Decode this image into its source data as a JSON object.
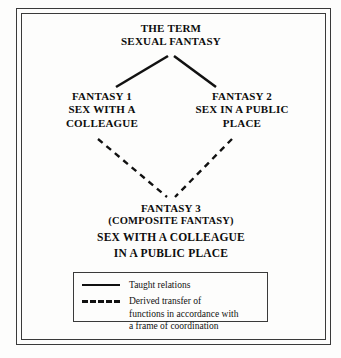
{
  "figure": {
    "background_color": "#fdfdfc",
    "border_color": "#3a3a3a",
    "line_color": "#111111"
  },
  "nodes": {
    "term": {
      "line1": "THE TERM",
      "line2": "SEXUAL FANTASY"
    },
    "fantasy1": {
      "line1": "FANTASY 1",
      "line2": "SEX WITH A",
      "line3": "COLLEAGUE"
    },
    "fantasy2": {
      "line1": "FANTASY 2",
      "line2": "SEX IN A PUBLIC",
      "line3": "PLACE"
    },
    "fantasy3": {
      "line1": "FANTASY 3",
      "line2": "(COMPOSITE FANTASY)",
      "line3": "SEX WITH A COLLEAGUE",
      "line4": "IN A PUBLIC PLACE"
    }
  },
  "legend": {
    "taught": {
      "label": "Taught relations",
      "style": "solid"
    },
    "derived": {
      "line1": "Derived transfer of",
      "line2": "functions in accordance with",
      "line3": "a frame of coordination",
      "style": "dashed"
    }
  },
  "connectors": [
    {
      "name": "taught-term-to-fantasy1",
      "style": "solid",
      "x1": 168,
      "y1": 56,
      "x2": 116,
      "y2": 87
    },
    {
      "name": "taught-term-to-fantasy2",
      "style": "solid",
      "x1": 174,
      "y1": 56,
      "x2": 216,
      "y2": 87
    },
    {
      "name": "derived-fantasy1-to-fantasy3",
      "style": "dashed",
      "x1": 98,
      "y1": 139,
      "x2": 167,
      "y2": 197
    },
    {
      "name": "derived-fantasy2-to-fantasy3",
      "style": "dashed",
      "x1": 232,
      "y1": 139,
      "x2": 175,
      "y2": 197
    }
  ]
}
